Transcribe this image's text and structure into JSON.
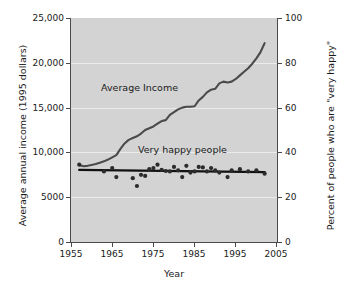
{
  "chart_data": {
    "type": "line",
    "title": "",
    "xlabel": "Year",
    "ylabel": "Average annual income (1995 dollars)",
    "y2label": "Percent of people who are \"very happy\"",
    "xlim": [
      1955,
      2005
    ],
    "ylim": [
      0,
      25000
    ],
    "y2lim": [
      0,
      100
    ],
    "grid": true,
    "legend": "inline-annotations",
    "plot_background": "#d3d3d3",
    "x_ticks": [
      1955,
      1965,
      1975,
      1985,
      1995,
      2005
    ],
    "x_tick_labels": [
      "1955",
      "1965",
      "1975",
      "1985",
      "1995",
      "2005"
    ],
    "y_ticks": [
      0,
      5000,
      10000,
      15000,
      20000,
      25000
    ],
    "y_tick_labels": [
      "0",
      "5000",
      "10,000",
      "15,000",
      "20,000",
      "25,000"
    ],
    "y2_ticks": [
      0,
      20,
      40,
      60,
      80,
      100
    ],
    "y2_tick_labels": [
      "0",
      "20",
      "40",
      "60",
      "80",
      "100"
    ],
    "annotations": [
      {
        "text": "Average Income",
        "x": 1968,
        "y": 13500
      },
      {
        "text": "Very happy people",
        "x": 1979,
        "y": 9400
      }
    ],
    "series": [
      {
        "name": "Average Income",
        "axis": "left",
        "type": "line",
        "color": "#4a4a4a",
        "x": [
          1957,
          1958,
          1959,
          1960,
          1961,
          1962,
          1963,
          1964,
          1965,
          1966,
          1967,
          1968,
          1969,
          1970,
          1971,
          1972,
          1973,
          1974,
          1975,
          1976,
          1977,
          1978,
          1979,
          1980,
          1981,
          1982,
          1983,
          1984,
          1985,
          1986,
          1987,
          1988,
          1989,
          1990,
          1991,
          1992,
          1993,
          1994,
          1995,
          1996,
          1997,
          1998,
          1999,
          2000,
          2001,
          2002
        ],
        "y": [
          8600,
          8450,
          8500,
          8600,
          8700,
          8850,
          9000,
          9200,
          9450,
          9700,
          10400,
          11000,
          11400,
          11600,
          11800,
          12100,
          12500,
          12700,
          12900,
          13200,
          13500,
          13600,
          14200,
          14500,
          14800,
          15000,
          15100,
          15100,
          15150,
          15800,
          16200,
          16700,
          17000,
          17100,
          17700,
          17900,
          17800,
          17900,
          18200,
          18600,
          19000,
          19400,
          19900,
          20500,
          21200,
          22200
        ]
      },
      {
        "name": "Very happy people (trend)",
        "axis": "right",
        "type": "line",
        "color": "#111111",
        "x": [
          1957,
          2002
        ],
        "y": [
          32.2,
          31.2
        ]
      },
      {
        "name": "Very happy people",
        "axis": "right",
        "type": "scatter",
        "color": "#2b2b2b",
        "x": [
          1957,
          1963,
          1965,
          1966,
          1970,
          1971,
          1972,
          1973,
          1974,
          1975,
          1976,
          1977,
          1978,
          1979,
          1980,
          1981,
          1982,
          1983,
          1984,
          1985,
          1986,
          1987,
          1988,
          1989,
          1990,
          1991,
          1993,
          1994,
          1996,
          1998,
          2000,
          2002
        ],
        "y": [
          34.5,
          31.5,
          33.0,
          29.0,
          28.5,
          25.0,
          30.0,
          29.5,
          32.5,
          33.0,
          34.5,
          32.2,
          31.7,
          31.5,
          33.5,
          32.0,
          29.0,
          34.0,
          31.0,
          31.5,
          33.5,
          33.3,
          31.5,
          33.0,
          32.0,
          31.0,
          29.0,
          32.0,
          32.5,
          31.5,
          32.0,
          30.5
        ]
      }
    ]
  },
  "axes": {
    "y_left": {
      "title": "Average annual income (1995 dollars)",
      "labels": [
        "25,000",
        "20,000",
        "15,000",
        "10,000",
        "5000",
        "0"
      ]
    },
    "y_right": {
      "title": "Percent of people who are \"very happy\"",
      "labels": [
        "100",
        "80",
        "60",
        "40",
        "20",
        "0"
      ]
    },
    "x": {
      "title": "Year",
      "labels": [
        "1955",
        "1965",
        "1975",
        "1985",
        "1995",
        "2005"
      ]
    }
  },
  "annotations": {
    "income_label": "Average Income",
    "happy_label": "Very happy people"
  }
}
